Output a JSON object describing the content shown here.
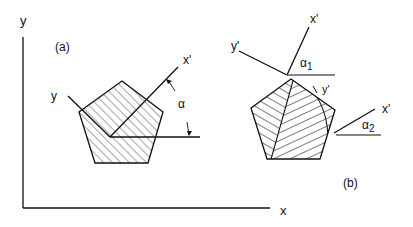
{
  "diagram": {
    "axes": {
      "x_label": "x",
      "y_label": "y"
    },
    "panel_a": {
      "label": "(a)",
      "rotated_axis_x": "x'",
      "rotated_axis_y": "y",
      "angle_label": "α"
    },
    "panel_b": {
      "label": "(b)",
      "region1": {
        "x_axis": "x'",
        "y_axis": "y'",
        "angle_label": "α",
        "angle_sub": "1"
      },
      "region2": {
        "x_axis": "x'",
        "y_axis": "y'",
        "angle_label": "α",
        "angle_sub": "2"
      }
    },
    "colors": {
      "stroke": "#111111",
      "background": "#ffffff"
    }
  }
}
